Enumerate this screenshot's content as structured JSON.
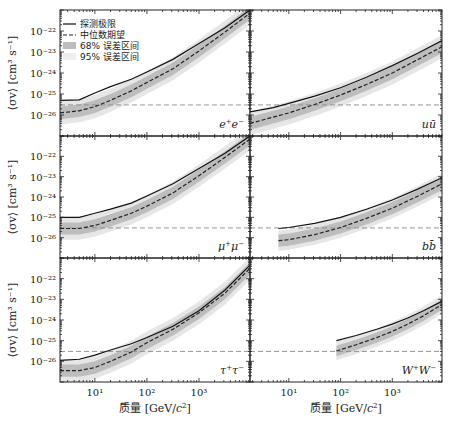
{
  "chart_data": {
    "type": "line",
    "layout": "3x2 grid of panels, shared axes",
    "xlabel": "质量 [GeV/c²]",
    "xlabel_parts": {
      "text": "质量 [GeV/",
      "c": "c",
      "sup": "2",
      "close": "]"
    },
    "ylabel": "⟨σv⟩ [cm³ s⁻¹]",
    "xscale": "log",
    "yscale": "log",
    "xlim_log10": [
      0.33,
      3.98
    ],
    "ylim_log10": [
      -27.0,
      -21.0
    ],
    "x_ticks": [
      "10¹",
      "10²",
      "10³"
    ],
    "x_tick_values_log10": [
      1,
      2,
      3
    ],
    "y_ticks": [
      "10⁻²²",
      "10⁻²³",
      "10⁻²⁴",
      "10⁻²⁵",
      "10⁻²⁶"
    ],
    "y_tick_values_log10": [
      -22,
      -23,
      -24,
      -25,
      -26
    ],
    "thermal_relic_log10": -25.52,
    "legend": {
      "position": "upper left of first panel",
      "entries": [
        {
          "label": "探测极限",
          "style": "solid"
        },
        {
          "label": "中位数期望",
          "style": "dashed"
        },
        {
          "label": "68% 误差区间",
          "style": "band-dark"
        },
        {
          "label": "95% 误差区间",
          "style": "band-light"
        }
      ]
    },
    "panels": [
      {
        "channel": "e⁺e⁻",
        "channel_parts": [
          "e",
          "+",
          "e",
          "−"
        ],
        "x_log10": [
          0.33,
          0.7,
          1.0,
          1.3,
          1.7,
          2.0,
          2.5,
          3.0,
          3.5,
          3.98
        ],
        "observed_log10": [
          -25.3,
          -25.28,
          -24.95,
          -24.65,
          -24.3,
          -23.95,
          -23.35,
          -22.6,
          -21.85,
          -21.0
        ],
        "expected_log10": [
          -25.9,
          -25.8,
          -25.6,
          -25.3,
          -24.85,
          -24.45,
          -23.8,
          -22.95,
          -22.05,
          -21.15
        ],
        "band68_half_width": 0.3,
        "band95_half_width": 0.55
      },
      {
        "channel": "uū",
        "channel_parts": [
          "u",
          "ū"
        ],
        "x_log10": [
          0.25,
          0.7,
          1.0,
          1.5,
          2.0,
          2.5,
          3.0,
          3.5,
          3.96
        ],
        "observed_log10": [
          -25.85,
          -25.65,
          -25.45,
          -25.1,
          -24.7,
          -24.2,
          -23.65,
          -23.05,
          -22.45
        ],
        "expected_log10": [
          -26.4,
          -26.1,
          -25.9,
          -25.5,
          -25.05,
          -24.55,
          -24.0,
          -23.35,
          -22.75
        ],
        "band68_half_width": 0.3,
        "band95_half_width": 0.55
      },
      {
        "channel": "μ⁺μ⁻",
        "channel_parts": [
          "μ",
          "+",
          "μ",
          "−"
        ],
        "x_log10": [
          0.33,
          0.7,
          1.0,
          1.3,
          1.7,
          2.0,
          2.5,
          3.0,
          3.5,
          3.98
        ],
        "observed_log10": [
          -25.0,
          -25.0,
          -24.8,
          -24.6,
          -24.3,
          -23.95,
          -23.35,
          -22.6,
          -21.85,
          -21.0
        ],
        "expected_log10": [
          -25.55,
          -25.55,
          -25.4,
          -25.15,
          -24.8,
          -24.45,
          -23.8,
          -22.95,
          -22.05,
          -21.15
        ],
        "band68_half_width": 0.3,
        "band95_half_width": 0.55
      },
      {
        "channel": "bb̄",
        "channel_parts": [
          "b",
          "b̄"
        ],
        "x_log10": [
          0.8,
          1.0,
          1.5,
          2.0,
          2.5,
          3.0,
          3.5,
          3.96
        ],
        "observed_log10": [
          -25.55,
          -25.5,
          -25.3,
          -25.0,
          -24.6,
          -24.15,
          -23.6,
          -23.05
        ],
        "expected_log10": [
          -26.15,
          -26.1,
          -25.85,
          -25.5,
          -25.05,
          -24.55,
          -23.95,
          -23.35
        ],
        "band68_half_width": 0.3,
        "band95_half_width": 0.5
      },
      {
        "channel": "τ⁺τ⁻",
        "channel_parts": [
          "τ",
          "+",
          "τ",
          "−"
        ],
        "x_log10": [
          0.33,
          0.7,
          1.0,
          1.3,
          1.7,
          2.0,
          2.5,
          3.0,
          3.5,
          3.98
        ],
        "observed_log10": [
          -25.95,
          -25.9,
          -25.7,
          -25.45,
          -25.15,
          -24.85,
          -24.3,
          -23.55,
          -22.55,
          -21.35
        ],
        "expected_log10": [
          -26.45,
          -26.45,
          -26.3,
          -26.0,
          -25.55,
          -25.1,
          -24.45,
          -23.65,
          -22.7,
          -21.5
        ],
        "band68_half_width": 0.3,
        "band95_half_width": 0.55
      },
      {
        "channel": "W⁺W⁻",
        "channel_parts": [
          "W",
          "+",
          "W",
          "−"
        ],
        "x_log10": [
          1.92,
          2.3,
          2.7,
          3.0,
          3.3,
          3.6,
          3.96
        ],
        "observed_log10": [
          -25.0,
          -24.75,
          -24.45,
          -24.2,
          -23.9,
          -23.55,
          -23.1
        ],
        "expected_log10": [
          -25.5,
          -25.2,
          -24.85,
          -24.55,
          -24.2,
          -23.8,
          -23.25
        ],
        "band68_half_width": 0.25,
        "band95_half_width": 0.45
      }
    ]
  },
  "figure": {
    "colors": {
      "observed": "#111111",
      "expected": "#222222",
      "band68": "#bdbdbd",
      "band95": "#e6e6e6",
      "relic": "#8a8a8a",
      "axes": "#222222"
    }
  }
}
